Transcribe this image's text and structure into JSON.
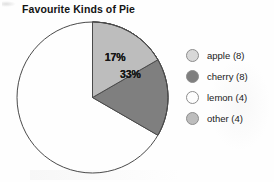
{
  "chart_data": {
    "type": "pie",
    "title": "Favourite Kinds of Pie",
    "categories": [
      "apple",
      "cherry",
      "lemon",
      "other"
    ],
    "values": [
      8,
      8,
      4,
      4
    ],
    "total": 24,
    "percent_labels": [
      "33%",
      "33%",
      "17%",
      "17%"
    ],
    "slice_percents": [
      33.3,
      33.3,
      16.7,
      16.7
    ],
    "colors": [
      "#d8d8d8",
      "#7f7f7f",
      "#fdfdfd",
      "#bdbdbd"
    ],
    "stroke": "#4a4a4a",
    "start_angle_deg": 0,
    "direction": "clockwise",
    "legend_position": "right",
    "legend_entries": [
      {
        "label": "apple (8)",
        "color": "#d8d8d8"
      },
      {
        "label": "cherry (8)",
        "color": "#7f7f7f"
      },
      {
        "label": "lemon (4)",
        "color": "#fdfdfd"
      },
      {
        "label": "other (4)",
        "color": "#bdbdbd"
      }
    ],
    "xlabel": "",
    "ylabel": "",
    "grid": false
  },
  "chart": {
    "title": "Favourite Kinds of Pie",
    "labels": {
      "apple": "33%",
      "cherry": "33%",
      "lemon": "17%",
      "other": "17%"
    }
  },
  "legend": {
    "items": [
      {
        "label": "apple (8)"
      },
      {
        "label": "cherry (8)"
      },
      {
        "label": "lemon (4)"
      },
      {
        "label": "other (4)"
      }
    ]
  }
}
